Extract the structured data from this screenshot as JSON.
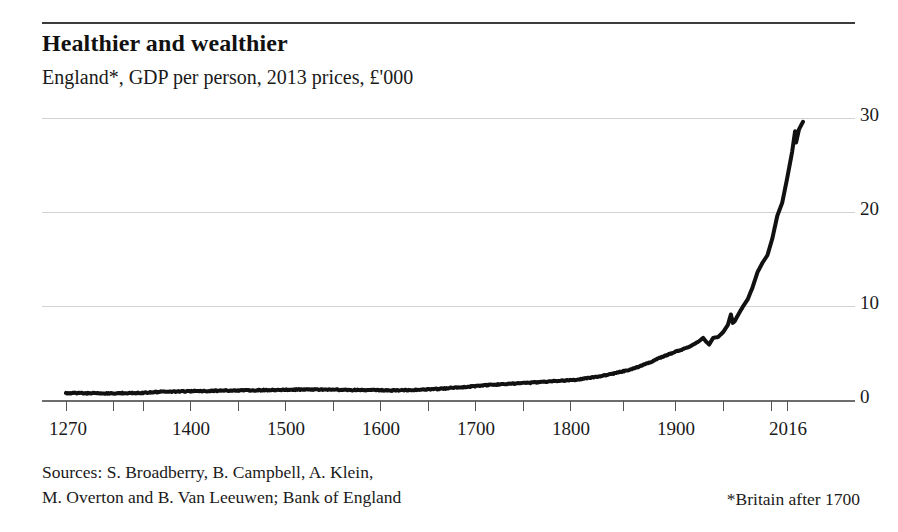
{
  "header": {
    "title": "Healthier and wealthier",
    "subtitle": "England*, GDP per person, 2013 prices, £'000"
  },
  "footer": {
    "sources_line1": "Sources: S. Broadberry, B. Campbell, A. Klein,",
    "sources_line2": "M. Overton and B. Van Leeuwen; Bank of England",
    "footnote": "*Britain after 1700"
  },
  "axis": {
    "y_ticks": [
      "30",
      "20",
      "10",
      "0"
    ],
    "x_ticks": [
      "1270",
      "1400",
      "1500",
      "1600",
      "1700",
      "1800",
      "1900",
      "2016"
    ]
  },
  "chart_data": {
    "type": "line",
    "title": "Healthier and wealthier",
    "subtitle": "England*, GDP per person, 2013 prices, £'000",
    "xlabel": "",
    "ylabel": "£'000 (2013 prices)",
    "xlim": [
      1270,
      2016
    ],
    "ylim": [
      0,
      30
    ],
    "yticks": [
      0,
      10,
      20,
      30
    ],
    "xticks": [
      1270,
      1400,
      1500,
      1600,
      1700,
      1800,
      1900,
      2016
    ],
    "xtick_labels": [
      "1270",
      "1400",
      "1500",
      "1600",
      "1700",
      "1800",
      "1900",
      "2016"
    ],
    "ytick_labels": [
      "0",
      "10",
      "20",
      "30"
    ],
    "grid": "horizontal",
    "legend": "none",
    "line_color": "#111111",
    "line_width_px": 4,
    "series": [
      {
        "name": "England GDP per person",
        "x": [
          1270,
          1280,
          1290,
          1300,
          1310,
          1320,
          1330,
          1340,
          1350,
          1360,
          1370,
          1380,
          1390,
          1400,
          1410,
          1420,
          1430,
          1440,
          1450,
          1460,
          1470,
          1480,
          1490,
          1500,
          1510,
          1520,
          1530,
          1540,
          1550,
          1560,
          1570,
          1580,
          1590,
          1600,
          1610,
          1620,
          1630,
          1640,
          1650,
          1660,
          1670,
          1680,
          1690,
          1700,
          1710,
          1720,
          1730,
          1740,
          1750,
          1760,
          1770,
          1780,
          1790,
          1800,
          1810,
          1820,
          1830,
          1840,
          1850,
          1860,
          1870,
          1880,
          1890,
          1900,
          1910,
          1915,
          1918,
          1921,
          1925,
          1930,
          1935,
          1940,
          1943,
          1945,
          1947,
          1950,
          1955,
          1960,
          1965,
          1970,
          1975,
          1980,
          1985,
          1990,
          1995,
          2000,
          2005,
          2008,
          2009,
          2012,
          2016
        ],
        "y": [
          0.72,
          0.74,
          0.73,
          0.72,
          0.7,
          0.71,
          0.74,
          0.73,
          0.78,
          0.85,
          0.88,
          0.9,
          0.92,
          0.95,
          0.96,
          0.98,
          1.0,
          1.01,
          1.02,
          1.03,
          1.05,
          1.07,
          1.08,
          1.1,
          1.11,
          1.12,
          1.12,
          1.1,
          1.08,
          1.07,
          1.06,
          1.05,
          1.03,
          1.02,
          1.04,
          1.06,
          1.1,
          1.14,
          1.2,
          1.28,
          1.36,
          1.44,
          1.52,
          1.62,
          1.66,
          1.72,
          1.8,
          1.84,
          1.92,
          1.98,
          2.04,
          2.1,
          2.2,
          2.35,
          2.52,
          2.72,
          2.95,
          3.2,
          3.55,
          3.95,
          4.45,
          4.85,
          5.25,
          5.6,
          6.2,
          6.6,
          6.2,
          5.9,
          6.6,
          6.7,
          7.2,
          8.0,
          9.1,
          8.2,
          8.4,
          9.0,
          9.9,
          10.7,
          12.0,
          13.6,
          14.6,
          15.4,
          17.2,
          19.6,
          21.0,
          23.6,
          26.4,
          28.6,
          27.4,
          28.8,
          29.6
        ]
      }
    ],
    "annotations": [
      {
        "label": "WWI peak then post-war dip",
        "x": 1918
      },
      {
        "label": "WWII peak then post-war dip",
        "x": 1943
      },
      {
        "label": "financial-crisis dip",
        "x": 2009
      }
    ]
  },
  "geometry": {
    "gridline_y_px": {
      "30": 18,
      "20": 112,
      "10": 206,
      "0": 300
    },
    "xtick_px": [
      24,
      148,
      243,
      338,
      433,
      528,
      633,
      745,
      761
    ]
  }
}
